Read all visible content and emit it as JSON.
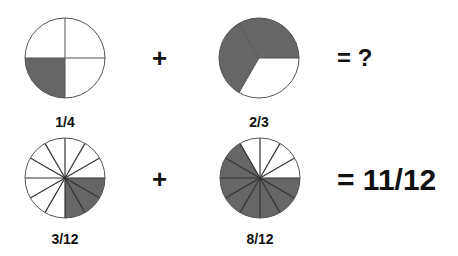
{
  "colors": {
    "shaded": "#666666",
    "unshaded": "#ffffff",
    "stroke": "#555555",
    "text": "#111111"
  },
  "row1": {
    "left": {
      "label": "1/4",
      "slices": 4,
      "shaded_slices": [
        1
      ],
      "start_angle_deg": 0,
      "center": [
        65,
        58
      ],
      "radius": 40
    },
    "plus": "+",
    "right": {
      "label": "2/3",
      "slices": 3,
      "shaded_slices": [
        1,
        2
      ],
      "start_angle_deg": 0,
      "center": [
        259,
        58
      ],
      "radius": 40
    },
    "result": "= ?"
  },
  "row2": {
    "left": {
      "label": "3/12",
      "slices": 12,
      "shaded_slices": [
        0,
        1,
        2
      ],
      "start_angle_deg": 0,
      "center": [
        65,
        178
      ],
      "radius": 40
    },
    "plus": "+",
    "right": {
      "label": "8/12",
      "slices": 12,
      "shaded_slices": [
        0,
        1,
        2,
        3,
        4,
        5,
        6,
        7
      ],
      "start_angle_deg": 0,
      "center": [
        260,
        178
      ],
      "radius": 40
    },
    "result": "= 11/12"
  }
}
